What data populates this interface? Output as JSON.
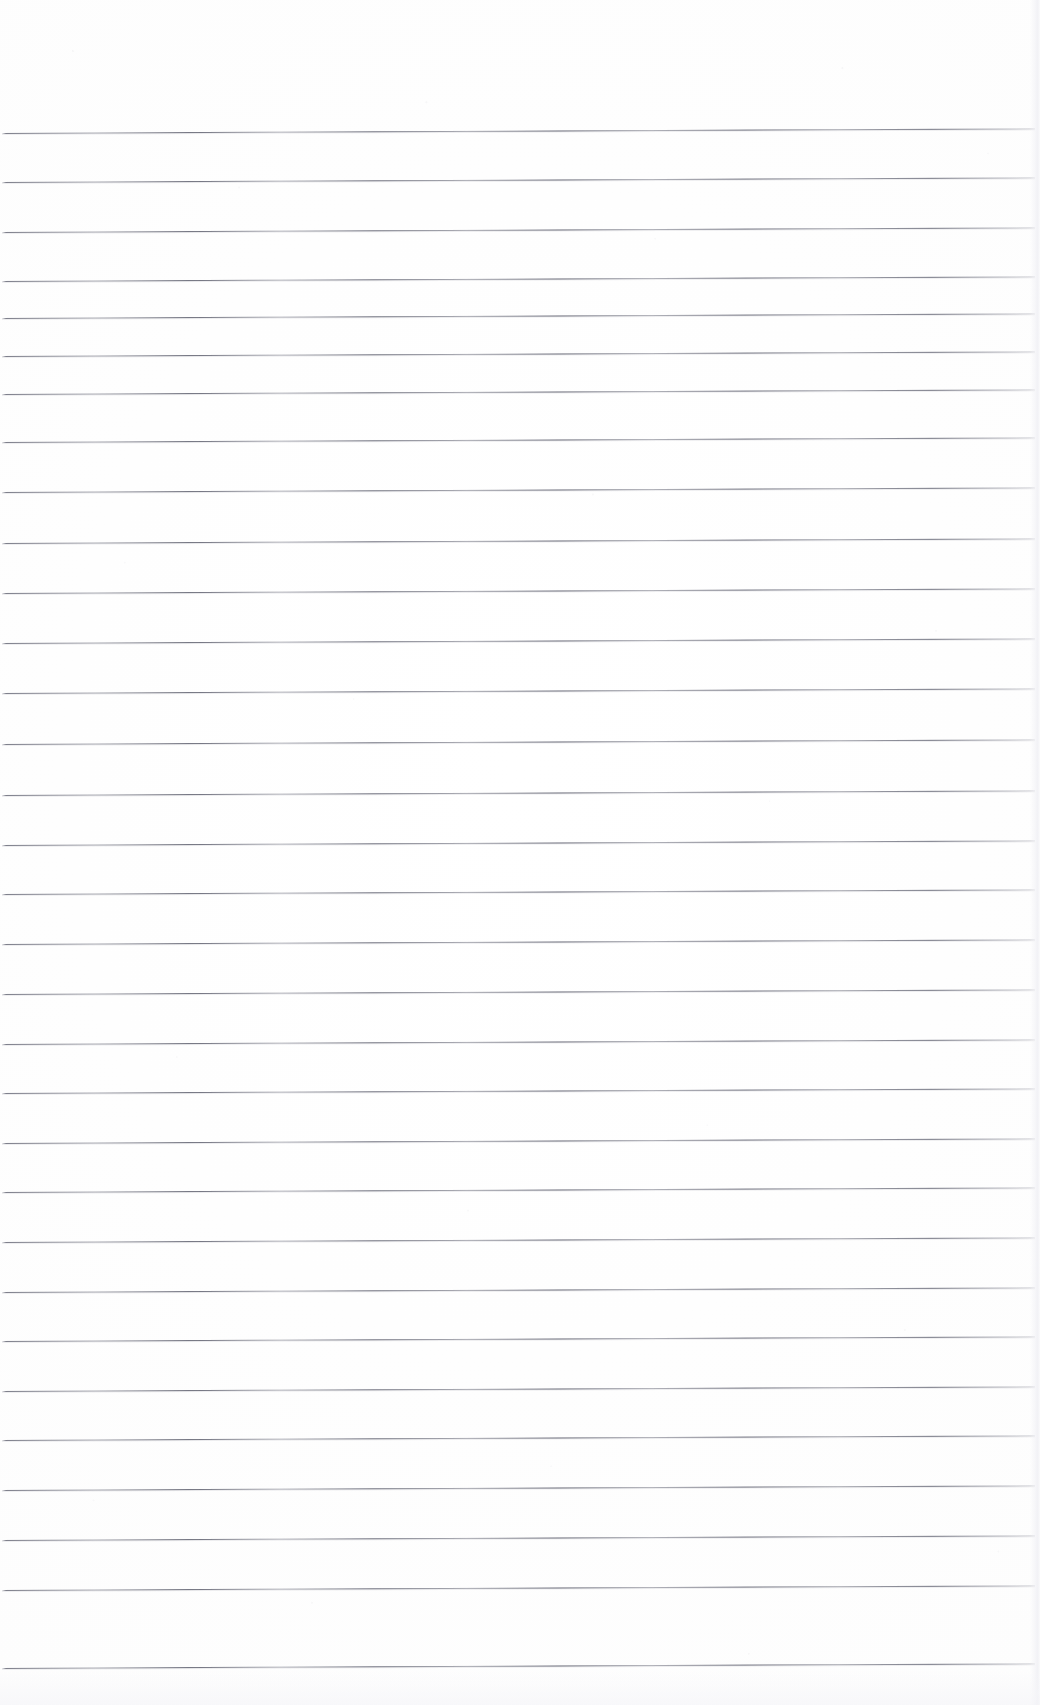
{
  "document": {
    "kind": "scanned-ruled-paper",
    "title": "Blank lined notebook page",
    "page_width": 1040,
    "page_height": 1705,
    "background_color": "#ffffff",
    "rule_color": "#5e6070",
    "page_edge_color": "#f0f0f4",
    "has_text_content": false,
    "has_margin_rule": false,
    "text_content": ""
  },
  "ruling": {
    "line_count": 32,
    "spacing_px": 49.5,
    "first_line_y": 133,
    "last_line_y": 1668,
    "line_start_x": 2,
    "line_end_x": 1035,
    "line_thickness_px": 1,
    "skew_degrees": -0.26,
    "top_margin_px": 133,
    "bottom_margin_px": 37,
    "lines": [
      {
        "index": 1,
        "y": 133
      },
      {
        "index": 2,
        "y": 182
      },
      {
        "index": 3,
        "y": 232
      },
      {
        "index": 4,
        "y": 281
      },
      {
        "index": 5,
        "y": 318
      },
      {
        "index": 6,
        "y": 356
      },
      {
        "index": 7,
        "y": 394
      },
      {
        "index": 8,
        "y": 442
      },
      {
        "index": 9,
        "y": 492
      },
      {
        "index": 10,
        "y": 543
      },
      {
        "index": 11,
        "y": 593
      },
      {
        "index": 12,
        "y": 643
      },
      {
        "index": 13,
        "y": 693
      },
      {
        "index": 14,
        "y": 744
      },
      {
        "index": 15,
        "y": 795
      },
      {
        "index": 16,
        "y": 845
      },
      {
        "index": 17,
        "y": 894
      },
      {
        "index": 18,
        "y": 944
      },
      {
        "index": 19,
        "y": 994
      },
      {
        "index": 20,
        "y": 1044
      },
      {
        "index": 21,
        "y": 1093
      },
      {
        "index": 22,
        "y": 1143
      },
      {
        "index": 23,
        "y": 1192
      },
      {
        "index": 24,
        "y": 1242
      },
      {
        "index": 25,
        "y": 1292
      },
      {
        "index": 26,
        "y": 1341
      },
      {
        "index": 27,
        "y": 1391
      },
      {
        "index": 28,
        "y": 1440
      },
      {
        "index": 29,
        "y": 1490
      },
      {
        "index": 30,
        "y": 1540
      },
      {
        "index": 31,
        "y": 1590
      },
      {
        "index": 32,
        "y": 1668
      }
    ]
  },
  "artifacts": {
    "scan_grain_visible": true,
    "right_page_edge_visible": true,
    "bottom_noise_band_visible": true
  }
}
